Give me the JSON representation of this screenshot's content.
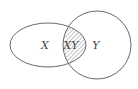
{
  "diagram": {
    "type": "venn",
    "sets": [
      {
        "id": "X",
        "label": "X",
        "shape": "ellipse"
      },
      {
        "id": "Y",
        "label": "Y",
        "shape": "circle"
      }
    ],
    "intersection": {
      "label": "XY",
      "fill": "hatched"
    },
    "colors": {
      "stroke": "#6b6b6b",
      "text": "#444444",
      "hatch": "#8a8a8a",
      "background": "#ffffff"
    }
  }
}
